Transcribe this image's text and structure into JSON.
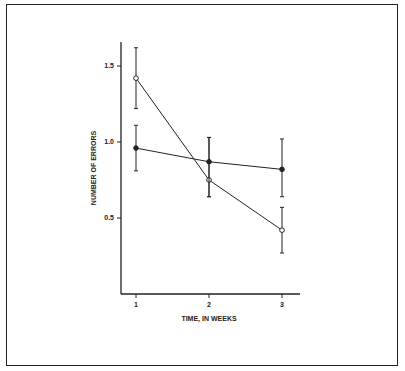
{
  "chart_data": {
    "type": "line",
    "title": "",
    "xlabel": "TIME, IN WEEKS",
    "ylabel": "NUMBER OF ERRORS",
    "x": [
      1,
      2,
      3
    ],
    "xticks": [
      "1",
      "2",
      "3"
    ],
    "yticks": [
      "0.5",
      "1.0",
      "1.5"
    ],
    "ylim": [
      0,
      1.7
    ],
    "series": [
      {
        "name": "open circles",
        "marker": "open-circle",
        "values": [
          1.42,
          0.75,
          0.42
        ],
        "err_low": [
          1.22,
          0.64,
          0.27
        ],
        "err_high": [
          1.62,
          1.03,
          0.57
        ]
      },
      {
        "name": "filled circles",
        "marker": "filled-circle",
        "values": [
          0.96,
          0.87,
          0.82
        ],
        "err_low": [
          0.81,
          0.64,
          0.64
        ],
        "err_high": [
          1.11,
          1.03,
          1.02
        ]
      }
    ],
    "legend": "none",
    "grid": false
  }
}
